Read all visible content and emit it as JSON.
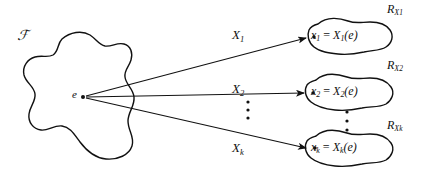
{
  "figure": {
    "type": "mapping-diagram",
    "caption_absent": true,
    "domain_region": {
      "name": "sample-space",
      "symbol": "ℱ"
    },
    "source_point": {
      "name": "outcome-point",
      "label": "e"
    },
    "mappings": [
      {
        "id": "map-1",
        "label": "X₁",
        "base": "X",
        "subscript": "1"
      },
      {
        "id": "map-2",
        "label": "X₂",
        "base": "X",
        "subscript": "2"
      },
      {
        "id": "map-3",
        "label": "Xₖ",
        "base": "X",
        "subscript": "k"
      }
    ],
    "vertical_ellipsis_center": "⋮",
    "vertical_ellipsis_right": "⋮",
    "ranges": [
      {
        "id": "range-1",
        "set_label_base": "R",
        "set_label_sub": "X",
        "set_label_sub2": "1",
        "equation_lhs": "x",
        "equation_lhs_sub": "1",
        "equation_rel": "=",
        "equation_rhs_base": "X",
        "equation_rhs_sub": "1",
        "equation_rhs_arg": "(e)",
        "equation_full": "x₁ = X₁(e)",
        "set_label_full": "R_X₁"
      },
      {
        "id": "range-2",
        "set_label_base": "R",
        "set_label_sub": "X",
        "set_label_sub2": "2",
        "equation_lhs": "x",
        "equation_lhs_sub": "2",
        "equation_rel": "=",
        "equation_rhs_base": "X",
        "equation_rhs_sub": "2",
        "equation_rhs_arg": "(e)",
        "equation_full": "x₂ = X₂(e)",
        "set_label_full": "R_X₂"
      },
      {
        "id": "range-3",
        "set_label_base": "R",
        "set_label_sub": "X",
        "set_label_sub2": "k",
        "equation_lhs": "x",
        "equation_lhs_sub": "k",
        "equation_rel": "=",
        "equation_rhs_base": "X",
        "equation_rhs_sub": "k",
        "equation_rhs_arg": "(e)",
        "equation_full": "xₖ = Xₖ(e)",
        "set_label_full": "R_Xₖ"
      }
    ],
    "colors": {
      "ink": "#111111",
      "background": "#ffffff"
    }
  }
}
